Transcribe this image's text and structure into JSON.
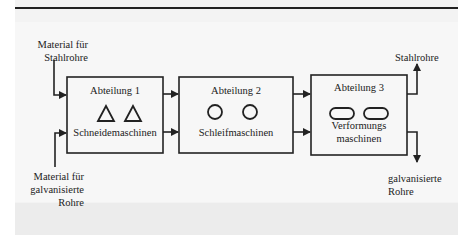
{
  "diagram": {
    "inputs": {
      "top": "Material für\nStahlrohre",
      "bottom": "Material für\ngalvanisierte\nRohre"
    },
    "departments": [
      {
        "title": "Abteilung 1",
        "machines": "Schneidemaschinen",
        "icon": "triangle-icon"
      },
      {
        "title": "Abteilung 2",
        "machines": "Schleifmaschinen",
        "icon": "circle-icon"
      },
      {
        "title": "Abteilung 3",
        "machines": "Verformungs\nmaschinen",
        "icon": "pill-icon"
      }
    ],
    "outputs": {
      "top": "Stahlrohre",
      "bottom": "galvanisierte\nRohre"
    },
    "colors": {
      "line": "#222222",
      "background": "#f3f3f3"
    }
  }
}
